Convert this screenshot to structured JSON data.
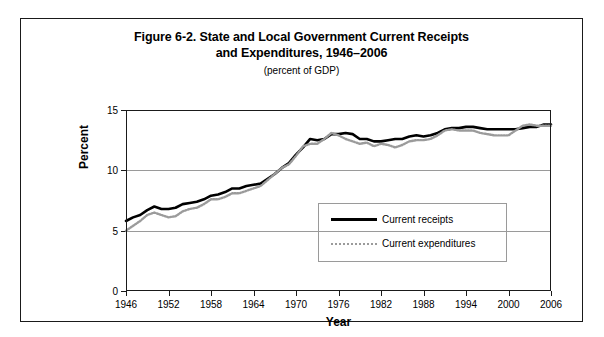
{
  "figure": {
    "title_line_1": "Figure 6-2. State and Local Government Current Receipts",
    "title_line_2": "and Expenditures, 1946–2006",
    "subtitle": "(percent of GDP)"
  },
  "axes": {
    "y_title": "Percent",
    "x_title": "Year",
    "y_ticks": [
      0,
      5,
      10,
      15
    ],
    "x_ticks": [
      1946,
      1952,
      1958,
      1964,
      1970,
      1976,
      1982,
      1988,
      1994,
      2000,
      2006
    ]
  },
  "legend": {
    "items": [
      {
        "label": "Current receipts",
        "color": "#000000",
        "style": "solid"
      },
      {
        "label": "Current expenditures",
        "color": "#9b9b9b",
        "style": "dotted"
      }
    ]
  },
  "chart_data": {
    "type": "line",
    "title": "Figure 6-2. State and Local Government Current Receipts and Expenditures, 1946–2006",
    "subtitle": "(percent of GDP)",
    "xlabel": "Year",
    "ylabel": "Percent",
    "xlim": [
      1946,
      2006
    ],
    "ylim": [
      0,
      15
    ],
    "yticks": [
      0,
      5,
      10,
      15
    ],
    "xticks": [
      1946,
      1952,
      1958,
      1964,
      1970,
      1976,
      1982,
      1988,
      1994,
      2000,
      2006
    ],
    "grid": "horizontal",
    "legend_position": "inside-lower-center",
    "x": [
      1946,
      1947,
      1948,
      1949,
      1950,
      1951,
      1952,
      1953,
      1954,
      1955,
      1956,
      1957,
      1958,
      1959,
      1960,
      1961,
      1962,
      1963,
      1964,
      1965,
      1966,
      1967,
      1968,
      1969,
      1970,
      1971,
      1972,
      1973,
      1974,
      1975,
      1976,
      1977,
      1978,
      1979,
      1980,
      1981,
      1982,
      1983,
      1984,
      1985,
      1986,
      1987,
      1988,
      1989,
      1990,
      1991,
      1992,
      1993,
      1994,
      1995,
      1996,
      1997,
      1998,
      1999,
      2000,
      2001,
      2002,
      2003,
      2004,
      2005,
      2006
    ],
    "series": [
      {
        "name": "Current receipts",
        "color": "#000000",
        "style": "solid",
        "values": [
          5.8,
          6.1,
          6.3,
          6.7,
          7.0,
          6.8,
          6.8,
          6.9,
          7.2,
          7.3,
          7.4,
          7.6,
          7.9,
          8.0,
          8.2,
          8.5,
          8.5,
          8.7,
          8.8,
          8.9,
          9.3,
          9.7,
          10.2,
          10.6,
          11.3,
          11.9,
          12.6,
          12.5,
          12.6,
          13.0,
          13.0,
          13.1,
          13.0,
          12.6,
          12.6,
          12.4,
          12.4,
          12.5,
          12.6,
          12.6,
          12.8,
          12.9,
          12.8,
          12.9,
          13.1,
          13.4,
          13.5,
          13.5,
          13.6,
          13.6,
          13.5,
          13.4,
          13.4,
          13.4,
          13.4,
          13.4,
          13.5,
          13.6,
          13.6,
          13.8,
          13.8
        ]
      },
      {
        "name": "Current expenditures",
        "color": "#9b9b9b",
        "style": "dotted",
        "values": [
          5.0,
          5.4,
          5.8,
          6.3,
          6.5,
          6.3,
          6.1,
          6.2,
          6.6,
          6.8,
          6.9,
          7.2,
          7.6,
          7.6,
          7.8,
          8.1,
          8.1,
          8.3,
          8.5,
          8.7,
          9.2,
          9.7,
          10.2,
          10.5,
          11.2,
          12.0,
          12.2,
          12.2,
          12.6,
          13.1,
          12.9,
          12.6,
          12.4,
          12.2,
          12.3,
          12.0,
          12.2,
          12.1,
          11.9,
          12.1,
          12.4,
          12.5,
          12.5,
          12.6,
          12.9,
          13.3,
          13.4,
          13.3,
          13.3,
          13.3,
          13.1,
          13.0,
          12.9,
          12.9,
          12.9,
          13.3,
          13.7,
          13.8,
          13.7,
          13.7,
          13.7
        ]
      }
    ]
  }
}
